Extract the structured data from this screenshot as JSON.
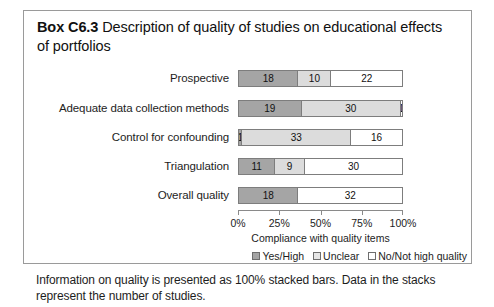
{
  "box": {
    "title_lead": "Box C6.3",
    "title_rest": " Description of quality of studies on educational effects of portfolios",
    "footnote": "Information on quality is presented as 100% stacked bars. Data in the stacks represent the number of studies."
  },
  "legend": {
    "items": [
      {
        "label": "Yes/High",
        "color": "#a5a5a5",
        "key": "yes"
      },
      {
        "label": "Unclear",
        "color": "#e6e6e6",
        "key": "unclear"
      },
      {
        "label": "No/Not high quality",
        "color": "#ffffff",
        "key": "no"
      }
    ]
  },
  "chart_data": {
    "type": "bar",
    "orientation": "horizontal",
    "stacked": true,
    "normalized": "100%",
    "title": "",
    "xlabel": "Compliance with quality items",
    "ylabel": "",
    "xlim": [
      0,
      100
    ],
    "xticks": [
      0,
      25,
      50,
      75,
      100
    ],
    "xticklabels": [
      "0%",
      "25%",
      "50%",
      "75%",
      "100%"
    ],
    "grid": false,
    "legend_position": "bottom-right",
    "categories": [
      "Prospective",
      "Adequate data collection methods",
      "Control for confounding",
      "Triangulation",
      "Overall quality"
    ],
    "series": [
      {
        "name": "Yes/High",
        "color": "#a5a5a5",
        "values": [
          18,
          19,
          1,
          11,
          18
        ]
      },
      {
        "name": "Unclear",
        "color": "#dcdcdc",
        "values": [
          10,
          30,
          33,
          9,
          0
        ]
      },
      {
        "name": "No/Not high quality",
        "color": "#ffffff",
        "values": [
          22,
          1,
          16,
          30,
          32
        ]
      }
    ],
    "rows": [
      {
        "category": "Prospective",
        "segments": [
          {
            "series": "Yes/High",
            "value": 18,
            "label": "18",
            "pct": 36.0
          },
          {
            "series": "Unclear",
            "value": 10,
            "label": "10",
            "pct": 20.0
          },
          {
            "series": "No/Not high quality",
            "value": 22,
            "label": "22",
            "pct": 44.0
          }
        ],
        "total": 50
      },
      {
        "category": "Adequate data collection methods",
        "segments": [
          {
            "series": "Yes/High",
            "value": 19,
            "label": "19",
            "pct": 38.0
          },
          {
            "series": "Unclear",
            "value": 30,
            "label": "30",
            "pct": 60.0
          },
          {
            "series": "No/Not high quality",
            "value": 1,
            "label": "1",
            "pct": 2.0
          }
        ],
        "total": 50
      },
      {
        "category": "Control for confounding",
        "segments": [
          {
            "series": "Yes/High",
            "value": 1,
            "label": "1",
            "pct": 2.0
          },
          {
            "series": "Unclear",
            "value": 33,
            "label": "33",
            "pct": 66.0
          },
          {
            "series": "No/Not high quality",
            "value": 16,
            "label": "16",
            "pct": 32.0
          }
        ],
        "total": 50
      },
      {
        "category": "Triangulation",
        "segments": [
          {
            "series": "Yes/High",
            "value": 11,
            "label": "11",
            "pct": 22.0
          },
          {
            "series": "Unclear",
            "value": 9,
            "label": "9",
            "pct": 18.0
          },
          {
            "series": "No/Not high quality",
            "value": 30,
            "label": "30",
            "pct": 60.0
          }
        ],
        "total": 50
      },
      {
        "category": "Overall quality",
        "segments": [
          {
            "series": "Yes/High",
            "value": 18,
            "label": "18",
            "pct": 36.0
          },
          {
            "series": "No/Not high quality",
            "value": 32,
            "label": "32",
            "pct": 64.0
          }
        ],
        "total": 50
      }
    ]
  }
}
